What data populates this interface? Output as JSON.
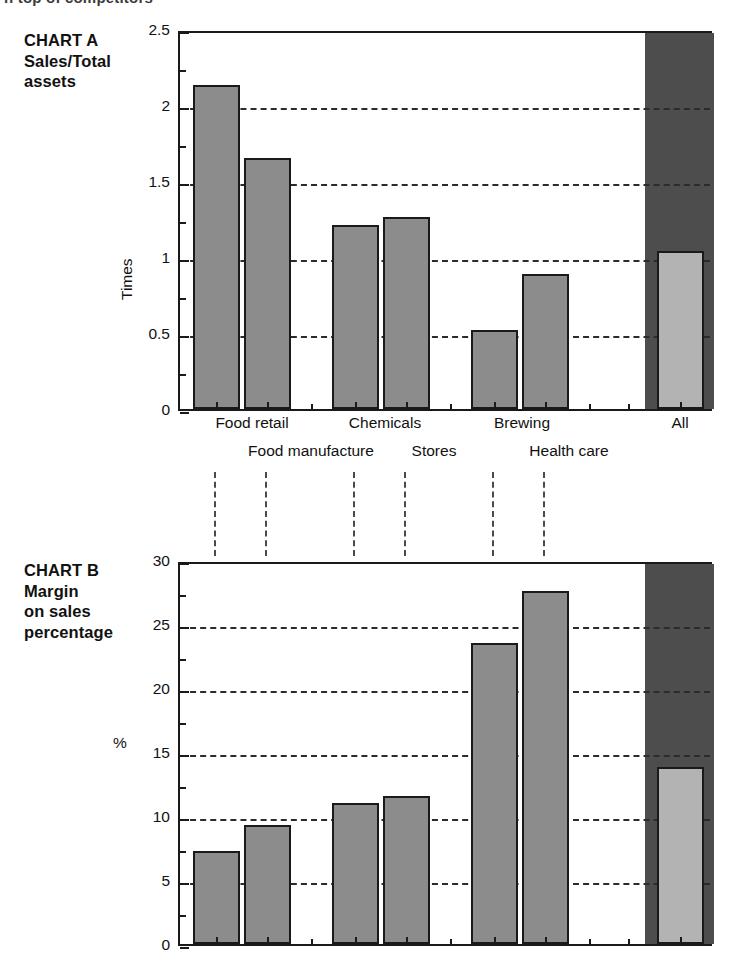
{
  "page": {
    "cut_off_heading": "n top of competitors"
  },
  "chart_data": [
    {
      "id": "chart-a",
      "type": "bar",
      "title": "CHART A",
      "subtitle": "Sales/Total\nassets",
      "ylabel": "Times",
      "xlabel": "",
      "ylim": [
        0,
        2.5
      ],
      "ytick_labels": [
        "0",
        "0.5",
        "1",
        "1.5",
        "2",
        "2.5"
      ],
      "ytick_values": [
        0,
        0.5,
        1,
        1.5,
        2,
        2.5
      ],
      "yminor_step": 0.25,
      "grid": "horizontal-dashed",
      "grid_values": [
        0.5,
        1,
        1.5,
        2
      ],
      "legend": "none",
      "categories": [
        "Food retail",
        "Food manufacture",
        "Chemicals",
        "Stores",
        "Brewing",
        "Health care",
        "All"
      ],
      "values": [
        2.13,
        1.65,
        1.21,
        1.26,
        0.52,
        0.89,
        1.04
      ],
      "highlight_category": "All",
      "highlight_panel_color": "#4d4d4d",
      "bar_color": "#8c8c8c",
      "highlight_bar_color": "#b3b3b3"
    },
    {
      "id": "chart-b",
      "type": "bar",
      "title": "CHART B",
      "subtitle": "Margin\non sales\npercentage",
      "ylabel": "%",
      "xlabel": "",
      "ylim": [
        0,
        30
      ],
      "ytick_labels": [
        "0",
        "5",
        "10",
        "15",
        "20",
        "25",
        "30"
      ],
      "ytick_values": [
        0,
        5,
        10,
        15,
        20,
        25,
        30
      ],
      "yminor_step": 2.5,
      "grid": "horizontal-dashed",
      "grid_values": [
        5,
        10,
        15,
        20,
        25
      ],
      "legend": "none",
      "categories": [
        "Food retail",
        "Food manufacture",
        "Chemicals",
        "Stores",
        "Brewing",
        "Health care",
        "All"
      ],
      "values": [
        7.3,
        9.3,
        11.0,
        11.6,
        23.5,
        27.6,
        13.8
      ],
      "highlight_category": "All",
      "highlight_panel_color": "#4d4d4d",
      "bar_color": "#8c8c8c",
      "highlight_bar_color": "#b3b3b3"
    }
  ],
  "axis_labels": {
    "row_top": [
      "Food retail",
      "Chemicals",
      "Brewing",
      "All"
    ],
    "row_bottom": [
      "Food manufacture",
      "Stores",
      "Health care"
    ]
  }
}
